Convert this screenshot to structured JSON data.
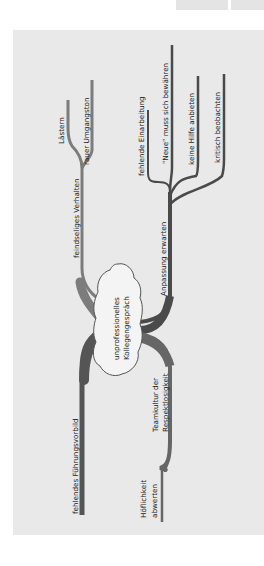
{
  "diagram": {
    "type": "mind-map",
    "orientation": "rotated-90-ccw",
    "colors": {
      "background": "#ffffff",
      "panel": "#e9e9e9",
      "branch_dark": "#4a4a4a",
      "branch_medium": "#7c7c7c",
      "cloud_fill": "#f4f4f4",
      "cloud_stroke": "#555555",
      "text": "#222222"
    },
    "center": {
      "line1": "unprofessionelles",
      "line2": "Kollegengespräch"
    },
    "branches": {
      "feindselig": {
        "label": "feindseliges Verhalten",
        "children": [
          "Lästern",
          "rauer Umgangston"
        ]
      },
      "anpassung": {
        "label": "Anpassung erwarten",
        "children": [
          "fehlende Einarbeitung",
          "\"Neue\" muss sich bewähren",
          "keine Hilfe anbieten",
          "kritisch beobachten"
        ]
      },
      "fuehrung": {
        "label": "fehlendes Führungsvorbild"
      },
      "teamkultur": {
        "line1": "Teamkultur der",
        "line2": "Respektlosigkeit",
        "children": [
          {
            "line1": "Höflichkeit",
            "line2": "abwerten"
          }
        ]
      }
    }
  }
}
